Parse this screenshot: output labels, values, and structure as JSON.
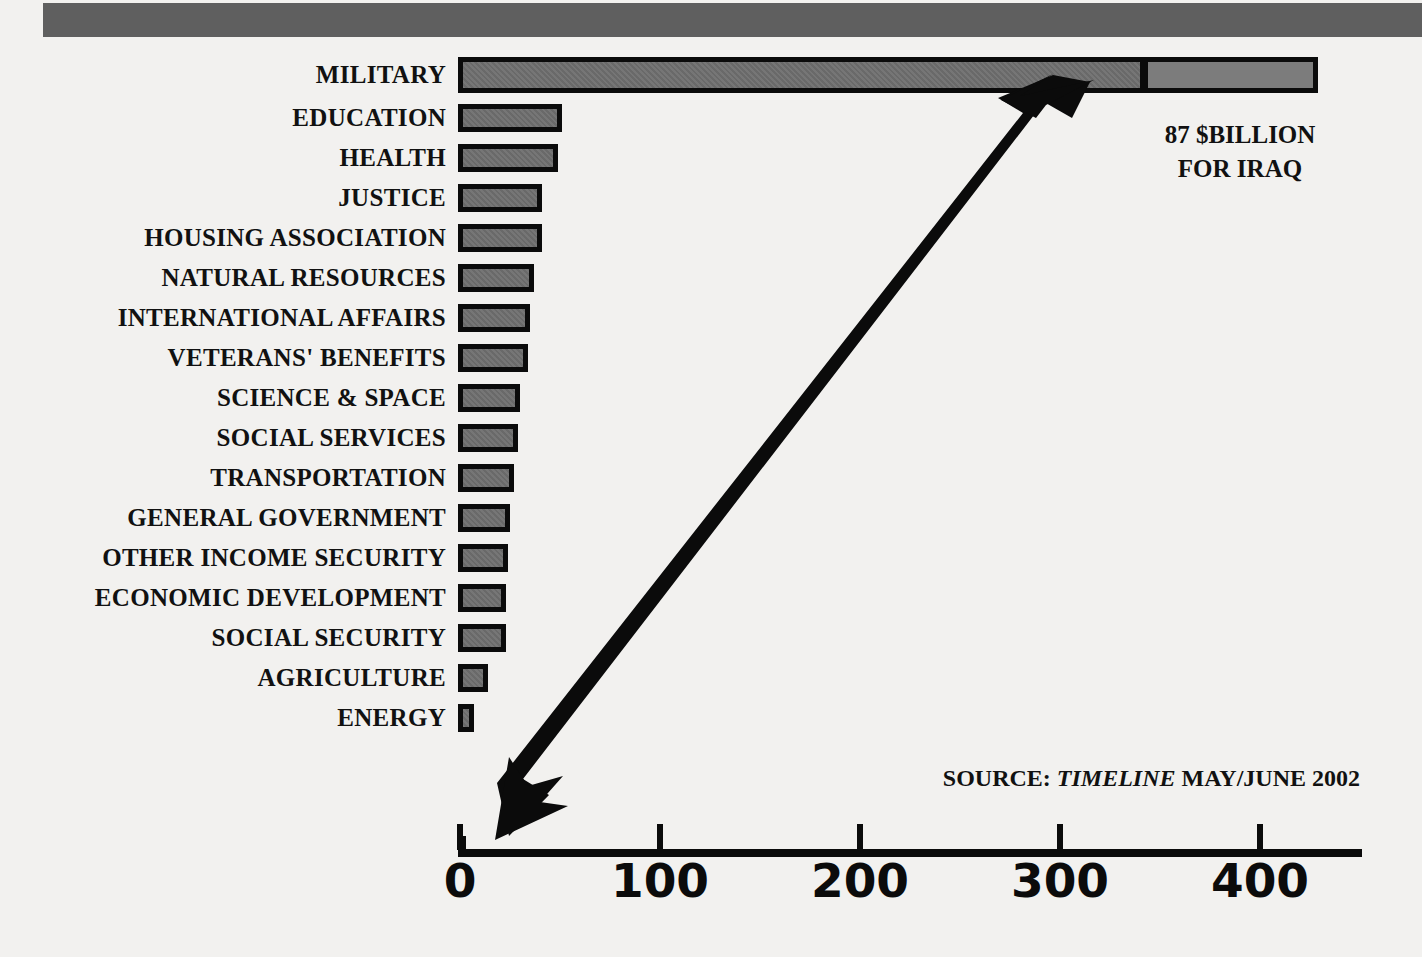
{
  "chart_data": {
    "type": "bar",
    "orientation": "horizontal",
    "title": "",
    "subtitle": "",
    "xlabel": "",
    "ylabel": "",
    "xlim": [
      0,
      452
    ],
    "xticks": [
      0,
      100,
      200,
      300,
      400
    ],
    "xtick_labels": [
      "0",
      "100",
      "200",
      "300",
      "400"
    ],
    "grid": false,
    "legend_position": "none",
    "unit": "$ billions",
    "categories": [
      "MILITARY",
      "EDUCATION",
      "HEALTH",
      "JUSTICE",
      "HOUSING ASSOCIATION",
      "NATURAL RESOURCES",
      "INTERNATIONAL AFFAIRS",
      "VETERANS' BENEFITS",
      "SCIENCE & SPACE",
      "SOCIAL SERVICES",
      "TRANSPORTATION",
      "GENERAL GOVERNMENT",
      "OTHER INCOME SECURITY",
      "ECONOMIC DEVELOPMENT",
      "SOCIAL SECURITY",
      "AGRICULTURE",
      "ENERGY"
    ],
    "values": [
      430,
      52,
      50,
      42,
      42,
      38,
      36,
      35,
      31,
      30,
      28,
      26,
      25,
      24,
      24,
      15,
      8
    ],
    "series": [
      {
        "name": "Base budget",
        "values": [
          343,
          52,
          50,
          42,
          42,
          38,
          36,
          35,
          31,
          30,
          28,
          26,
          25,
          24,
          24,
          15,
          8
        ]
      },
      {
        "name": "87 $BILLION FOR IRAQ supplement",
        "values": [
          87,
          0,
          0,
          0,
          0,
          0,
          0,
          0,
          0,
          0,
          0,
          0,
          0,
          0,
          0,
          0,
          0
        ]
      }
    ],
    "annotations": [
      {
        "name": "iraq-callout",
        "text_lines": [
          "87 $BILLION",
          "FOR IRAQ"
        ],
        "target_category": "MILITARY"
      },
      {
        "name": "source-note",
        "prefix": "SOURCE: ",
        "publication": "TIMELINE",
        "suffix": " MAY/JUNE 2002"
      }
    ],
    "colors": {
      "bar_fill": "#6e6e6e",
      "bar_fill_segment2": "#7c7c7c",
      "bar_outline": "#0b0b0b",
      "axis": "#0b0b0b",
      "text": "#111111",
      "top_band": "#5f5f5f",
      "background": "#f2f1ef"
    }
  },
  "annotations": {
    "iraq_line1": "87 $BILLION",
    "iraq_line2": "FOR IRAQ",
    "source_prefix": "SOURCE: ",
    "source_publication": "TIMELINE",
    "source_suffix": " MAY/JUNE 2002"
  }
}
